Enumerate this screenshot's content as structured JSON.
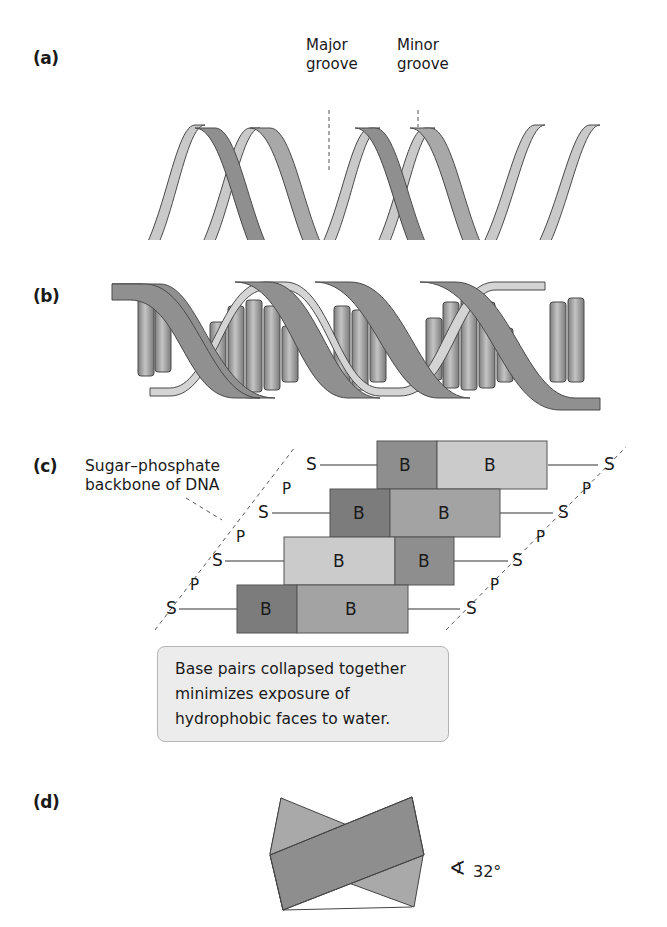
{
  "figure": {
    "panels": [
      {
        "id": "a",
        "label": "(a)",
        "labels": {
          "major_groove": [
            "Major",
            "groove"
          ],
          "minor_groove": [
            "Minor",
            "groove"
          ]
        },
        "description": "Ribbon double helix showing major and minor grooves"
      },
      {
        "id": "b",
        "label": "(b)",
        "description": "Double helix with stacked cylindrical base pairs between ribbon backbones"
      },
      {
        "id": "c",
        "label": "(c)",
        "backbone_label": [
          "Sugar–phosphate",
          "backbone of DNA"
        ],
        "base_label": "B",
        "sugar_label": "S",
        "phosphate_label": "P",
        "rows": [
          {
            "left": "B",
            "right": "B"
          },
          {
            "left": "B",
            "right": "B"
          },
          {
            "left": "B",
            "right": "B"
          },
          {
            "left": "B",
            "right": "B"
          }
        ],
        "callout": [
          "Base pairs collapsed together",
          "minimizes exposure of",
          "hydrophobic faces to water."
        ]
      },
      {
        "id": "d",
        "label": "(d)",
        "angle_symbol": "∢",
        "angle_value": "32°",
        "description": "Two overlapping base-pair slabs rotated 32 degrees relative to each other"
      }
    ],
    "colors": {
      "strand_light": "#c9c9c9",
      "strand_dark": "#8f8f8f",
      "base_dark": "#8a8a8a",
      "base_mid": "#a3a3a3",
      "base_light": "#cbcbcb",
      "outline": "#4a4a4a",
      "callout_bg": "#ececec"
    }
  }
}
